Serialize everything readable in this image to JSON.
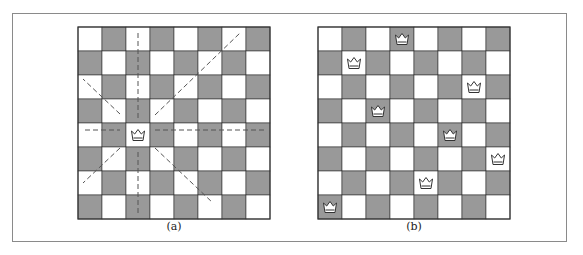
{
  "figure": {
    "panels": [
      {
        "id": "a",
        "caption": "(a)",
        "board_size": 8,
        "queens": [
          {
            "row": 4,
            "col": 2
          }
        ],
        "attack_lines": "dashed lines through queen along row, column and both diagonals"
      },
      {
        "id": "b",
        "caption": "(b)",
        "board_size": 8,
        "queens": [
          {
            "row": 0,
            "col": 3
          },
          {
            "row": 1,
            "col": 1
          },
          {
            "row": 2,
            "col": 6
          },
          {
            "row": 3,
            "col": 2
          },
          {
            "row": 4,
            "col": 5
          },
          {
            "row": 5,
            "col": 7
          },
          {
            "row": 6,
            "col": 4
          },
          {
            "row": 7,
            "col": 0
          }
        ]
      }
    ],
    "colors": {
      "dark_square": "#999999",
      "light_square": "#ffffff",
      "grid_line": "#333333",
      "dash_line": "#555555",
      "frame": "#8a8a8a"
    },
    "queen_glyph": "crown-icon"
  }
}
